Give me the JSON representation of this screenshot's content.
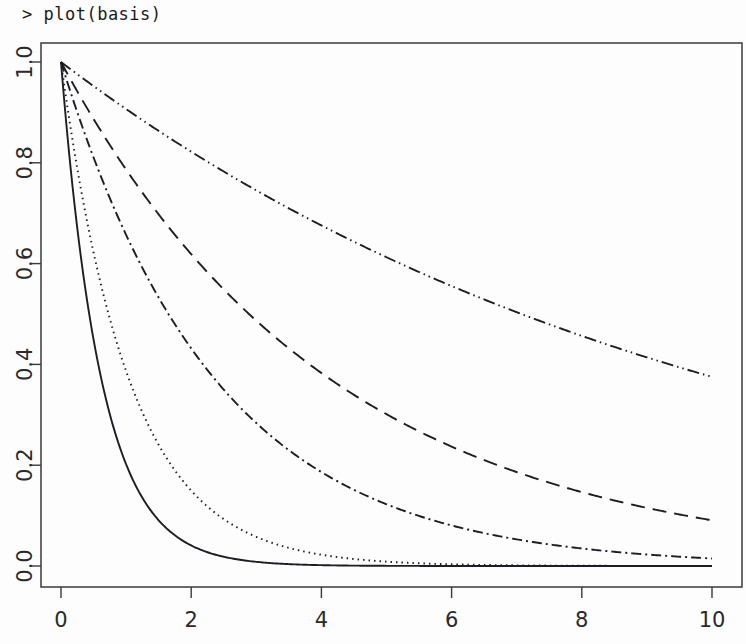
{
  "console": {
    "prompt": "> plot(basis)"
  },
  "colors": {
    "background": "#fdfdfd",
    "axis": "#3a3a3a",
    "curve": "#1d1d23",
    "text": "#2a2a2a"
  },
  "chart_data": {
    "type": "line",
    "title": "",
    "xlabel": "",
    "ylabel": "",
    "xlim": [
      0,
      10
    ],
    "ylim": [
      0.0,
      1.0
    ],
    "grid": false,
    "legend": "none",
    "xticks": [
      "0",
      "2",
      "4",
      "6",
      "8",
      "10"
    ],
    "xtick_values": [
      0,
      2,
      4,
      6,
      8,
      10
    ],
    "yticks": [
      "0.0",
      "0.2",
      "0.4",
      "0.6",
      "0.8",
      "1.0"
    ],
    "ytick_values": [
      0.0,
      0.2,
      0.4,
      0.6,
      0.8,
      1.0
    ],
    "ytick_rotation": 90,
    "x": [
      0,
      0.5,
      1,
      1.5,
      2,
      2.5,
      3,
      3.5,
      4,
      4.5,
      5,
      5.5,
      6,
      6.5,
      7,
      7.5,
      8,
      8.5,
      9,
      9.5,
      10
    ],
    "series": [
      {
        "name": "basis-1",
        "linestyle": "solid",
        "dasharray": "",
        "decay_rate": 1.6,
        "values": [
          1.0,
          0.449,
          0.202,
          0.091,
          0.041,
          0.018,
          0.008,
          0.004,
          0.002,
          0.001,
          0.0003,
          0.0002,
          0.0001,
          0.0,
          0.0,
          0.0,
          0.0,
          0.0,
          0.0,
          0.0,
          0.0
        ]
      },
      {
        "name": "basis-2",
        "linestyle": "dotted",
        "dasharray": "1.5 4",
        "decay_rate": 0.95,
        "values": [
          1.0,
          0.622,
          0.387,
          0.241,
          0.15,
          0.093,
          0.058,
          0.036,
          0.022,
          0.014,
          0.0087,
          0.0054,
          0.0034,
          0.0021,
          0.0013,
          0.0008,
          0.0005,
          0.0003,
          0.0002,
          0.0001,
          0.0001
        ]
      },
      {
        "name": "basis-3",
        "linestyle": "dotdash",
        "dasharray": "10 4 2 4",
        "decay_rate": 0.42,
        "values": [
          1.0,
          0.811,
          0.657,
          0.533,
          0.432,
          0.35,
          0.284,
          0.23,
          0.186,
          0.151,
          0.122,
          0.099,
          0.08,
          0.065,
          0.053,
          0.043,
          0.035,
          0.028,
          0.023,
          0.019,
          0.015
        ]
      },
      {
        "name": "basis-4",
        "linestyle": "dashed",
        "dasharray": "14 8",
        "decay_rate": 0.24,
        "values": [
          1.0,
          0.887,
          0.787,
          0.698,
          0.619,
          0.549,
          0.487,
          0.432,
          0.383,
          0.34,
          0.301,
          0.267,
          0.237,
          0.21,
          0.186,
          0.165,
          0.147,
          0.13,
          0.115,
          0.102,
          0.091
        ]
      },
      {
        "name": "basis-5",
        "linestyle": "twodash",
        "dasharray": "12 4 1.5 4 1.5 4",
        "decay_rate": 0.098,
        "values": [
          1.0,
          0.952,
          0.907,
          0.863,
          0.822,
          0.783,
          0.746,
          0.71,
          0.676,
          0.644,
          0.613,
          0.584,
          0.556,
          0.529,
          0.504,
          0.48,
          0.457,
          0.435,
          0.414,
          0.394,
          0.375
        ]
      }
    ]
  },
  "plot_geometry": {
    "left": 41,
    "right": 742,
    "top": 43,
    "bottom": 587,
    "x0_px": 61,
    "x10_px": 712,
    "y0_px": 566,
    "y1_px": 62
  }
}
